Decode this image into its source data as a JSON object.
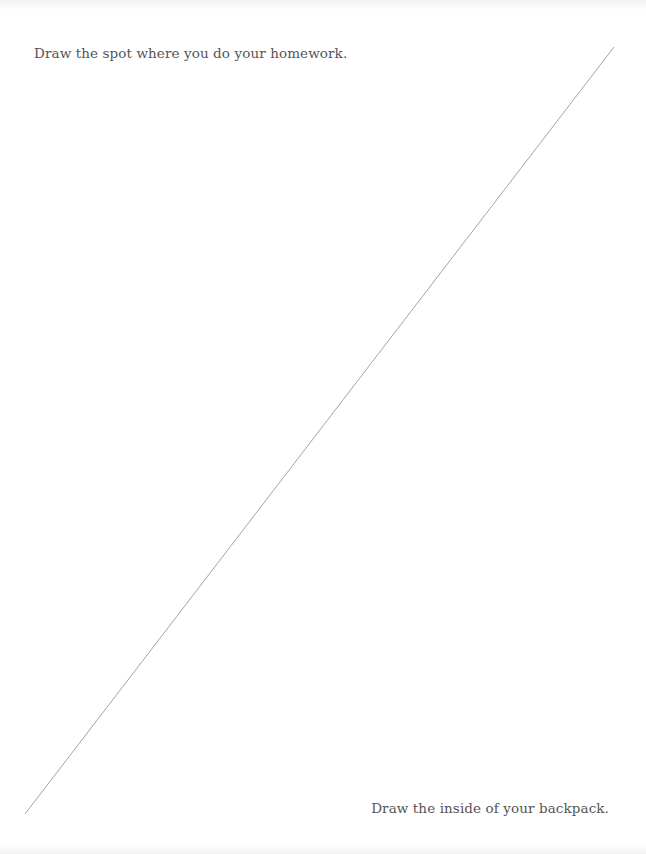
{
  "page": {
    "prompts": {
      "top": "Draw the spot where you do your homework.",
      "bottom": "Draw the inside of your backpack."
    },
    "divider": {
      "x1": 614,
      "y1": 47,
      "x2": 25,
      "y2": 814,
      "color": "#9a9a9a"
    }
  }
}
